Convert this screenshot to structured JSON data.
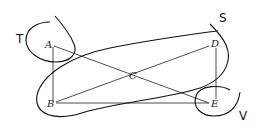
{
  "diagram": {
    "points": [
      {
        "id": "A",
        "label": "A",
        "x": 50,
        "y": 45
      },
      {
        "id": "B",
        "label": "B",
        "x": 52,
        "y": 103
      },
      {
        "id": "C",
        "label": "C",
        "x": 133,
        "y": 76
      },
      {
        "id": "D",
        "label": "D",
        "x": 214,
        "y": 43
      },
      {
        "id": "E",
        "label": "E",
        "x": 215,
        "y": 103
      }
    ],
    "edges": [
      [
        "A",
        "B"
      ],
      [
        "A",
        "E"
      ],
      [
        "B",
        "D"
      ],
      [
        "B",
        "E"
      ],
      [
        "D",
        "E"
      ]
    ],
    "regions": [
      {
        "id": "T",
        "label": "T",
        "contains": [
          "A"
        ]
      },
      {
        "id": "S",
        "label": "S",
        "contains": [
          "B",
          "C",
          "E"
        ]
      },
      {
        "id": "V",
        "label": "V",
        "contains": [
          "E"
        ]
      }
    ],
    "colors": {
      "stroke": "#111111",
      "background": "#ffffff"
    }
  }
}
